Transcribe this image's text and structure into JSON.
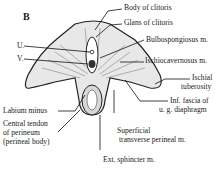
{
  "figure": {
    "panel_letter": "B",
    "labels": {
      "body_of_clitoris": "Body of clitoris",
      "glans_of_clitoris": "Glans of clitoris",
      "bulbospongiosus": "Bulbospongiosus m.",
      "ischiocavernosus": "Ischiocavernosus m.",
      "ischial_tuberosity_1": "Ischial",
      "ischial_tuberosity_2": "tuberosity",
      "inf_fascia_1": "Inf. fascia of",
      "inf_fascia_2": "u. g. diaphragm",
      "superficial_1": "Superficial",
      "superficial_2": "transverse perineal m.",
      "ext_sphincter": "Ext. sphincter m.",
      "urethra": "U.",
      "vagina": "V.",
      "labium_minus": "Labium minus",
      "central_tendon_1": "Central tendon",
      "central_tendon_2": "of perineum",
      "central_tendon_3": "(perineal body)"
    }
  }
}
